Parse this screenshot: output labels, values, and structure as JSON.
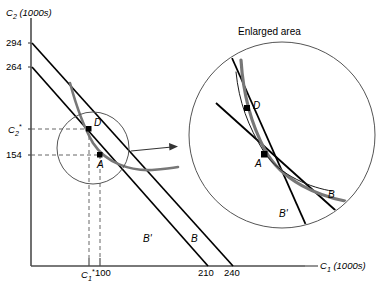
{
  "figure": {
    "type": "intertemporal-budget-indifference-diagram",
    "inset_title": "Enlarged area",
    "axes": {
      "y_title": "C2 (1000s)",
      "y_title_base": "C",
      "y_title_sub": "2",
      "y_title_unit": " (1000s)",
      "x_title_base": "C",
      "x_title_sub": "1",
      "x_title_unit": " (1000s)",
      "y_ticks": [
        {
          "label": "294",
          "value": 294
        },
        {
          "label": "264",
          "value": 264
        },
        {
          "label": "C2*",
          "value": 190,
          "is_star": true,
          "base": "C",
          "sub": "2",
          "sup": "*"
        },
        {
          "label": "154",
          "value": 154
        }
      ],
      "x_ticks": [
        {
          "label": "C1*",
          "value": 89,
          "is_star": true,
          "base": "C",
          "sub": "1",
          "sup": "*"
        },
        {
          "label": "100",
          "value": 100
        },
        {
          "label": "210",
          "value": 210
        },
        {
          "label": "240",
          "value": 240
        }
      ]
    },
    "points": [
      {
        "name": "D",
        "label": "D",
        "where": "main"
      },
      {
        "name": "A",
        "label": "A",
        "where": "main"
      },
      {
        "name": "D",
        "label": "D",
        "where": "inset"
      },
      {
        "name": "A",
        "label": "A",
        "where": "inset"
      }
    ],
    "curve_labels": {
      "budget_b": "B",
      "budget_b_prime": "B'",
      "inset_budget_b": "B",
      "inset_budget_b_prime": "B'"
    },
    "series": [
      {
        "name": "budget-line-B",
        "label": "B",
        "y_intercept": 294,
        "x_intercept": 240,
        "style": "solid-thin-black"
      },
      {
        "name": "budget-line-B-prime",
        "label": "B'",
        "y_intercept": 264,
        "x_intercept": 210,
        "style": "solid-thin-black"
      },
      {
        "name": "indifference-curve-high",
        "label": "",
        "style": "thick-gray",
        "through": "A"
      },
      {
        "name": "indifference-curve-low",
        "label": "",
        "style": "thin-black",
        "through": "A"
      }
    ],
    "colors": {
      "axis": "#4d4d4d",
      "line": "#000000",
      "indifference_gray": "#777777",
      "dashed": "#555555",
      "circle": "#555555"
    }
  }
}
